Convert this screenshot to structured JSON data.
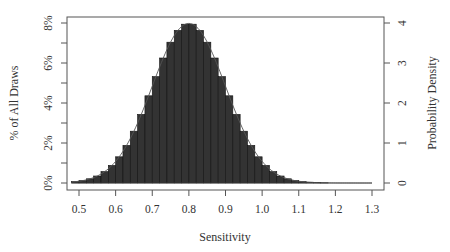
{
  "chart_data": {
    "type": "bar",
    "title": "",
    "xlabel": "Sensitivity",
    "ylabel": "% of All Draws",
    "ylabel_right": "Probability Density",
    "xlim": [
      0.47,
      1.33
    ],
    "ylim": [
      0,
      8
    ],
    "ylim_right": [
      0,
      4
    ],
    "x_ticks": [
      "0.5",
      "0.6",
      "0.7",
      "0.8",
      "0.9",
      "1.0",
      "1.1",
      "1.2",
      "1.3"
    ],
    "x_tick_values": [
      0.5,
      0.6,
      0.7,
      0.8,
      0.9,
      1.0,
      1.1,
      1.2,
      1.3
    ],
    "y_ticks": [
      "0%",
      "2%",
      "4%",
      "6%",
      "8%"
    ],
    "y_tick_values": [
      0,
      2,
      4,
      6,
      8
    ],
    "y_minor_tick_values": [
      1,
      3,
      5,
      7
    ],
    "y_right_ticks": [
      "0",
      "1",
      "2",
      "3",
      "4"
    ],
    "y_right_tick_values": [
      0,
      1,
      2,
      3,
      4
    ],
    "grid": false,
    "legend": null,
    "bin_width": 0.02,
    "bin_starts": [
      0.48,
      0.5,
      0.52,
      0.54,
      0.56,
      0.58,
      0.6,
      0.62,
      0.64,
      0.66,
      0.68,
      0.7,
      0.72,
      0.74,
      0.76,
      0.78,
      0.8,
      0.82,
      0.84,
      0.86,
      0.88,
      0.9,
      0.92,
      0.94,
      0.96,
      0.98,
      1.0,
      1.02,
      1.04,
      1.06,
      1.08,
      1.1,
      1.12,
      1.14,
      1.16,
      1.18,
      1.2,
      1.22,
      1.24,
      1.26,
      1.28
    ],
    "values": [
      0.07,
      0.12,
      0.21,
      0.35,
      0.57,
      0.88,
      1.31,
      1.88,
      2.59,
      3.43,
      4.36,
      5.32,
      6.25,
      7.04,
      7.63,
      7.94,
      7.94,
      7.63,
      7.04,
      6.25,
      5.32,
      4.36,
      3.43,
      2.59,
      1.88,
      1.31,
      0.88,
      0.57,
      0.35,
      0.21,
      0.12,
      0.07,
      0.04,
      0.02,
      0.01,
      0.0,
      0.0,
      0.0,
      0.0,
      0.0,
      0.0
    ],
    "series": [
      {
        "name": "histogram (% of all draws)",
        "type": "bar",
        "color": "#333333"
      },
      {
        "name": "density curve",
        "type": "line",
        "color": "#333333",
        "mean": 0.8,
        "sd": 0.1
      }
    ]
  }
}
